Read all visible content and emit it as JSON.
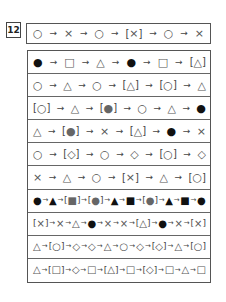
{
  "question_number": "12",
  "prompt_sequence": [
    "○",
    "→",
    "×",
    "→",
    "○",
    "→",
    "[×]",
    "→",
    "○",
    "→",
    "×"
  ],
  "options": [
    {
      "text": "● → □ → △ → ● → □ → [△]",
      "tokens": [
        "●",
        "→",
        "□",
        "→",
        "△",
        "→",
        "●",
        "→",
        "□",
        "→",
        "[△]"
      ]
    },
    {
      "text": "○ → △ → ○ → [△] → [○] → △",
      "tokens": [
        "○",
        "→",
        "△",
        "→",
        "○",
        "→",
        "[△]",
        "→",
        "[○]",
        "→",
        "△"
      ]
    },
    {
      "text": "[○] → △ → [●] → ○ → △ → ●",
      "tokens": [
        "[○]",
        "→",
        "△",
        "→",
        "[●]",
        "→",
        "○",
        "→",
        "△",
        "→",
        "●"
      ]
    },
    {
      "text": "△ → [●] → × → [△] → ● → ×",
      "tokens": [
        "△",
        "→",
        "[●]",
        "→",
        "×",
        "→",
        "[△]",
        "→",
        "●",
        "→",
        "×"
      ]
    },
    {
      "text": "○ → [◇] → ○ → ◇ → [○] → ◇",
      "tokens": [
        "○",
        "→",
        "[◇]",
        "→",
        "○",
        "→",
        "◇",
        "→",
        "[○]",
        "→",
        "◇"
      ]
    },
    {
      "text": "× → △ → ○ → [×] → △ → [○]",
      "tokens": [
        "×",
        "→",
        "△",
        "→",
        "○",
        "→",
        "[×]",
        "→",
        "△",
        "→",
        "[○]"
      ]
    },
    {
      "text": "● → ▲ → [■] → [●] → ▲ → ■ → [●] → ▲ → ■ → ●",
      "tokens": [
        "●",
        "→",
        "▲",
        "→",
        "[■]",
        "→",
        "[●]",
        "→",
        "▲",
        "→",
        "■",
        "→",
        "[●]",
        "→",
        "▲",
        "→",
        "■",
        "→",
        "●"
      ]
    },
    {
      "text": "[×] → × → △ → ● → × → × → [△] → ● → × → [×]",
      "tokens": [
        "[×]",
        "→",
        "×",
        "→",
        "△",
        "→",
        "●",
        "→",
        "×",
        "→",
        "×",
        "→",
        "[△]",
        "→",
        "●",
        "→",
        "×",
        "→",
        "[×]"
      ]
    },
    {
      "text": "△ → [○] → ◇ → ◇ → △ → ○ → ◇ → [◇] → △ → [○]",
      "tokens": [
        "△",
        "→",
        "[○]",
        "→",
        "◇",
        "→",
        "◇",
        "→",
        "△",
        "→",
        "○",
        "→",
        "◇",
        "→",
        "[◇]",
        "→",
        "△",
        "→",
        "[○]"
      ]
    },
    {
      "text": "△ → [□] → ◇ → □ → [△] → □ → [◇] → □ → △ → □",
      "tokens": [
        "△",
        "→",
        "[□]",
        "→",
        "◇",
        "→",
        "□",
        "→",
        "[△]",
        "→",
        "□",
        "→",
        "[◇]",
        "→",
        "□",
        "→",
        "△",
        "→",
        "□"
      ]
    }
  ]
}
